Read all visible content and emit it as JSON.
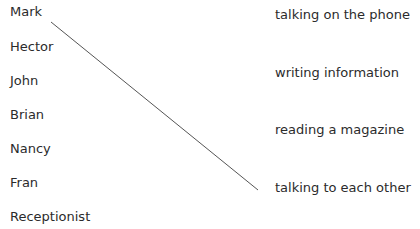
{
  "exercise": {
    "people": [
      {
        "label": "Mark",
        "y": 8
      },
      {
        "label": "Hector",
        "y": 43
      },
      {
        "label": "John",
        "y": 77
      },
      {
        "label": "Brian",
        "y": 111
      },
      {
        "label": "Nancy",
        "y": 145
      },
      {
        "label": "Fran",
        "y": 179
      },
      {
        "label": "Receptionist",
        "y": 213
      }
    ],
    "activities": [
      {
        "label": "talking on the phone",
        "y": 11
      },
      {
        "label": "writing information",
        "y": 69
      },
      {
        "label": "reading a magazine",
        "y": 126
      },
      {
        "label": "talking to each other",
        "y": 184
      }
    ],
    "connections": [
      {
        "from": "Mark",
        "to": "talking to each other",
        "x1": 51,
        "y1": 22,
        "x2": 258,
        "y2": 190
      }
    ],
    "line_color": "#555555"
  }
}
